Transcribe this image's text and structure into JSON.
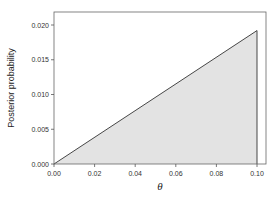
{
  "chart_data": {
    "type": "area",
    "title": "",
    "xlabel": "θ",
    "ylabel": "Posterior probability",
    "x": [
      0.0,
      0.1
    ],
    "values": [
      0.0,
      0.0192
    ],
    "xlim": [
      0.0,
      0.1
    ],
    "ylim": [
      0.0,
      0.02
    ],
    "xticks": [
      "0.00",
      "0.02",
      "0.04",
      "0.06",
      "0.08",
      "0.10"
    ],
    "yticks": [
      "0.000",
      "0.005",
      "0.010",
      "0.015",
      "0.020"
    ],
    "grid": false,
    "legend": null,
    "fill_color": "#e3e3e3",
    "line_color": "#333333"
  }
}
